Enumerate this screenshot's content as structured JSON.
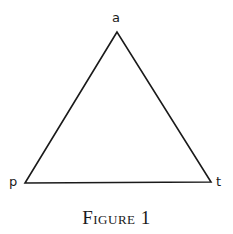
{
  "figure": {
    "caption": "Figure 1",
    "shape": "triangle",
    "stroke_color": "#1a1a1a",
    "vertices": [
      {
        "label": "a",
        "x": 117,
        "y": 32
      },
      {
        "label": "p",
        "x": 25,
        "y": 183
      },
      {
        "label": "t",
        "x": 211,
        "y": 182
      }
    ]
  }
}
